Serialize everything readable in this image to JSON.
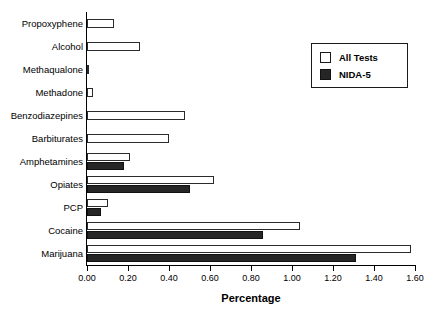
{
  "chart_data": {
    "type": "bar",
    "orientation": "horizontal",
    "title": "",
    "xlabel": "Percentage",
    "ylabel": "",
    "xlim": [
      0.0,
      1.6
    ],
    "xticks": [
      "0.00",
      "0.20",
      "0.40",
      "0.60",
      "0.80",
      "1.00",
      "1.20",
      "1.40",
      "1.60"
    ],
    "xtick_values": [
      0.0,
      0.2,
      0.4,
      0.6,
      0.8,
      1.0,
      1.2,
      1.4,
      1.6
    ],
    "grid": false,
    "legend_position": "upper right",
    "categories": [
      "Propoxyphene",
      "Alcohol",
      "Methaqualone",
      "Methadone",
      "Benzodiazepines",
      "Barbiturates",
      "Amphetamines",
      "Opiates",
      "PCP",
      "Cocaine",
      "Marijuana"
    ],
    "series": [
      {
        "name": "All Tests",
        "color": "#ffffff",
        "edge_color": "#2b2b2b",
        "values": [
          0.13,
          0.26,
          0.01,
          0.03,
          0.48,
          0.4,
          0.21,
          0.62,
          0.1,
          1.04,
          1.58
        ]
      },
      {
        "name": "NIDA-5",
        "color": "#262626",
        "edge_color": "#111111",
        "values": [
          null,
          null,
          null,
          null,
          null,
          null,
          0.18,
          0.5,
          0.07,
          0.86,
          1.31
        ]
      }
    ]
  },
  "legend": {
    "items": [
      {
        "label": "All Tests",
        "swatch": "all"
      },
      {
        "label": "NIDA-5",
        "swatch": "nida"
      }
    ]
  }
}
